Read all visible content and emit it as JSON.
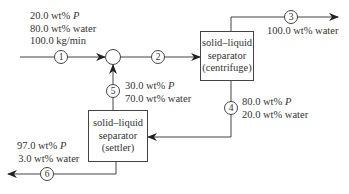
{
  "diagram": {
    "type": "process-flow",
    "units": {
      "mixer": {
        "label": ""
      },
      "centrifuge": {
        "line1": "solid–liquid",
        "line2": "separator",
        "line3": "(centrifuge)"
      },
      "settler": {
        "line1": "solid–liquid",
        "line2": "separator",
        "line3": "(settler)"
      }
    },
    "streams": {
      "s1": {
        "number": "1",
        "line1_value": "20.0 wt% ",
        "line1_var": "P",
        "line2": "80.0 wt% water",
        "line3": "100.0 kg/min"
      },
      "s2": {
        "number": "2"
      },
      "s3": {
        "number": "3",
        "line1": "100.0 wt% water"
      },
      "s4": {
        "number": "4",
        "line1_value": "80.0 wt% ",
        "line1_var": "P",
        "line2": "20.0 wt% water"
      },
      "s5": {
        "number": "5",
        "line1_value": "30.0 wt% ",
        "line1_var": "P",
        "line2": "70.0 wt% water"
      },
      "s6": {
        "number": "6",
        "line1_value": "97.0 wt% ",
        "line1_var": "P",
        "line2": "3.0 wt% water"
      }
    },
    "colors": {
      "line": "#444444",
      "text": "#333333",
      "background": "#ffffff"
    }
  }
}
